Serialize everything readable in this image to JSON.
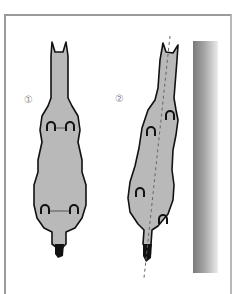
{
  "diagram": {
    "figures": [
      {
        "id": 1,
        "label": "①",
        "description": "horse viewed from above, straight alignment, left/right hooves paired"
      },
      {
        "id": 2,
        "label": "②",
        "description": "horse viewed from above, angled alignment along dashed line beside wall"
      }
    ],
    "elements": {
      "horse_fill": "#b9b9b9",
      "outline": "#111111",
      "wall_colors": [
        "#7a7a7a",
        "#eeeeee"
      ],
      "border_color": "#9a9a9a"
    }
  }
}
